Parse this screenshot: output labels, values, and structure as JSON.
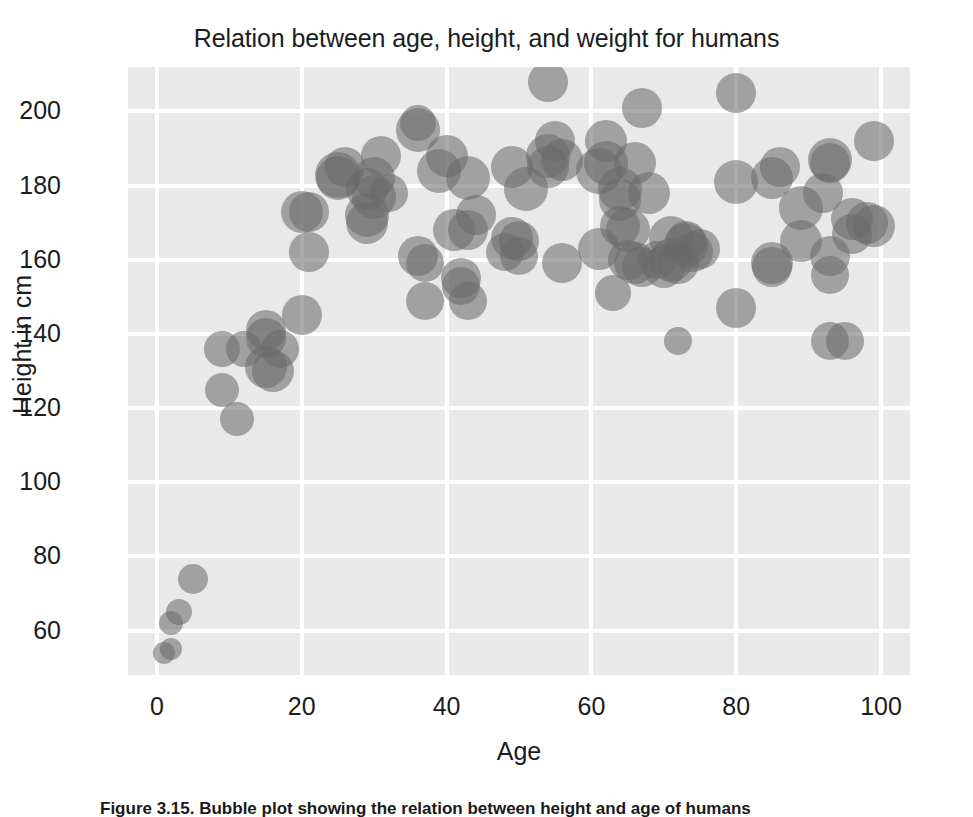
{
  "chart_data": {
    "type": "scatter",
    "title": "Relation between age, height, and weight for humans",
    "xlabel": "Age",
    "ylabel": "Height in cm",
    "xlim": [
      -4,
      104
    ],
    "ylim": [
      48,
      212
    ],
    "xticks": [
      0,
      20,
      40,
      60,
      80,
      100
    ],
    "yticks": [
      60,
      80,
      100,
      120,
      140,
      160,
      180,
      200
    ],
    "grid": true,
    "legend": null,
    "marker_color": "#696969",
    "marker_alpha": 0.56,
    "plot_background": "#e9e9e9",
    "gridline_color": "#ffffff",
    "size_encodes": "weight",
    "series": [
      {
        "name": "humans",
        "points": [
          {
            "age": 1,
            "height": 54,
            "size": 11
          },
          {
            "age": 2,
            "height": 55,
            "size": 11
          },
          {
            "age": 2,
            "height": 62,
            "size": 12
          },
          {
            "age": 3,
            "height": 65,
            "size": 13
          },
          {
            "age": 5,
            "height": 74,
            "size": 15
          },
          {
            "age": 9,
            "height": 136,
            "size": 18
          },
          {
            "age": 9,
            "height": 125,
            "size": 17
          },
          {
            "age": 11,
            "height": 117,
            "size": 17
          },
          {
            "age": 12,
            "height": 136,
            "size": 18
          },
          {
            "age": 15,
            "height": 141,
            "size": 20
          },
          {
            "age": 15,
            "height": 139,
            "size": 20
          },
          {
            "age": 15,
            "height": 131,
            "size": 21
          },
          {
            "age": 16,
            "height": 130,
            "size": 21
          },
          {
            "age": 17,
            "height": 136,
            "size": 19
          },
          {
            "age": 20,
            "height": 145,
            "size": 20
          },
          {
            "age": 20,
            "height": 173,
            "size": 21
          },
          {
            "age": 21,
            "height": 173,
            "size": 20
          },
          {
            "age": 21,
            "height": 162,
            "size": 20
          },
          {
            "age": 25,
            "height": 183,
            "size": 23
          },
          {
            "age": 25,
            "height": 182,
            "size": 22
          },
          {
            "age": 26,
            "height": 185,
            "size": 20
          },
          {
            "age": 29,
            "height": 179,
            "size": 21
          },
          {
            "age": 29,
            "height": 172,
            "size": 22
          },
          {
            "age": 29,
            "height": 170,
            "size": 21
          },
          {
            "age": 30,
            "height": 182,
            "size": 21
          },
          {
            "age": 30,
            "height": 177,
            "size": 22
          },
          {
            "age": 31,
            "height": 188,
            "size": 20
          },
          {
            "age": 32,
            "height": 178,
            "size": 19
          },
          {
            "age": 36,
            "height": 197,
            "size": 18
          },
          {
            "age": 36,
            "height": 195,
            "size": 22
          },
          {
            "age": 36,
            "height": 161,
            "size": 20
          },
          {
            "age": 37,
            "height": 159,
            "size": 19
          },
          {
            "age": 37,
            "height": 149,
            "size": 19
          },
          {
            "age": 39,
            "height": 184,
            "size": 22
          },
          {
            "age": 40,
            "height": 188,
            "size": 21
          },
          {
            "age": 41,
            "height": 168,
            "size": 21
          },
          {
            "age": 42,
            "height": 155,
            "size": 20
          },
          {
            "age": 42,
            "height": 153,
            "size": 19
          },
          {
            "age": 43,
            "height": 168,
            "size": 20
          },
          {
            "age": 43,
            "height": 182,
            "size": 22
          },
          {
            "age": 43,
            "height": 149,
            "size": 19
          },
          {
            "age": 44,
            "height": 172,
            "size": 20
          },
          {
            "age": 48,
            "height": 162,
            "size": 19
          },
          {
            "age": 49,
            "height": 185,
            "size": 21
          },
          {
            "age": 49,
            "height": 166,
            "size": 21
          },
          {
            "age": 50,
            "height": 165,
            "size": 20
          },
          {
            "age": 50,
            "height": 161,
            "size": 19
          },
          {
            "age": 51,
            "height": 179,
            "size": 22
          },
          {
            "age": 54,
            "height": 208,
            "size": 20
          },
          {
            "age": 54,
            "height": 185,
            "size": 21
          },
          {
            "age": 54,
            "height": 188,
            "size": 22
          },
          {
            "age": 55,
            "height": 192,
            "size": 20
          },
          {
            "age": 56,
            "height": 187,
            "size": 21
          },
          {
            "age": 56,
            "height": 159,
            "size": 20
          },
          {
            "age": 61,
            "height": 184,
            "size": 23
          },
          {
            "age": 61,
            "height": 163,
            "size": 21
          },
          {
            "age": 62,
            "height": 192,
            "size": 21
          },
          {
            "age": 62,
            "height": 186,
            "size": 22
          },
          {
            "age": 63,
            "height": 151,
            "size": 18
          },
          {
            "age": 64,
            "height": 179,
            "size": 22
          },
          {
            "age": 64,
            "height": 176,
            "size": 21
          },
          {
            "age": 64,
            "height": 169,
            "size": 20
          },
          {
            "age": 65,
            "height": 168,
            "size": 22
          },
          {
            "age": 65,
            "height": 160,
            "size": 20
          },
          {
            "age": 66,
            "height": 159,
            "size": 21
          },
          {
            "age": 66,
            "height": 186,
            "size": 21
          },
          {
            "age": 67,
            "height": 201,
            "size": 20
          },
          {
            "age": 67,
            "height": 158,
            "size": 20
          },
          {
            "age": 68,
            "height": 178,
            "size": 21
          },
          {
            "age": 69,
            "height": 160,
            "size": 19
          },
          {
            "age": 70,
            "height": 158,
            "size": 21
          },
          {
            "age": 71,
            "height": 166,
            "size": 22
          },
          {
            "age": 71,
            "height": 160,
            "size": 22
          },
          {
            "age": 72,
            "height": 138,
            "size": 14
          },
          {
            "age": 72,
            "height": 159,
            "size": 21
          },
          {
            "age": 73,
            "height": 164,
            "size": 22
          },
          {
            "age": 73,
            "height": 165,
            "size": 20
          },
          {
            "age": 74,
            "height": 162,
            "size": 20
          },
          {
            "age": 75,
            "height": 163,
            "size": 20
          },
          {
            "age": 80,
            "height": 205,
            "size": 20
          },
          {
            "age": 80,
            "height": 181,
            "size": 22
          },
          {
            "age": 80,
            "height": 147,
            "size": 20
          },
          {
            "age": 85,
            "height": 182,
            "size": 21
          },
          {
            "age": 85,
            "height": 159,
            "size": 21
          },
          {
            "age": 85,
            "height": 158,
            "size": 20
          },
          {
            "age": 86,
            "height": 185,
            "size": 20
          },
          {
            "age": 89,
            "height": 174,
            "size": 22
          },
          {
            "age": 89,
            "height": 165,
            "size": 21
          },
          {
            "age": 92,
            "height": 178,
            "size": 20
          },
          {
            "age": 93,
            "height": 187,
            "size": 22
          },
          {
            "age": 93,
            "height": 186,
            "size": 20
          },
          {
            "age": 93,
            "height": 161,
            "size": 20
          },
          {
            "age": 93,
            "height": 156,
            "size": 19
          },
          {
            "age": 93,
            "height": 138,
            "size": 19
          },
          {
            "age": 95,
            "height": 138,
            "size": 19
          },
          {
            "age": 96,
            "height": 171,
            "size": 21
          },
          {
            "age": 96,
            "height": 167,
            "size": 20
          },
          {
            "age": 98,
            "height": 170,
            "size": 21
          },
          {
            "age": 99,
            "height": 192,
            "size": 20
          },
          {
            "age": 99,
            "height": 169,
            "size": 21
          }
        ]
      }
    ]
  },
  "caption": {
    "text": "Figure 3.15. Bubble plot showing the relation between height and age of humans"
  }
}
